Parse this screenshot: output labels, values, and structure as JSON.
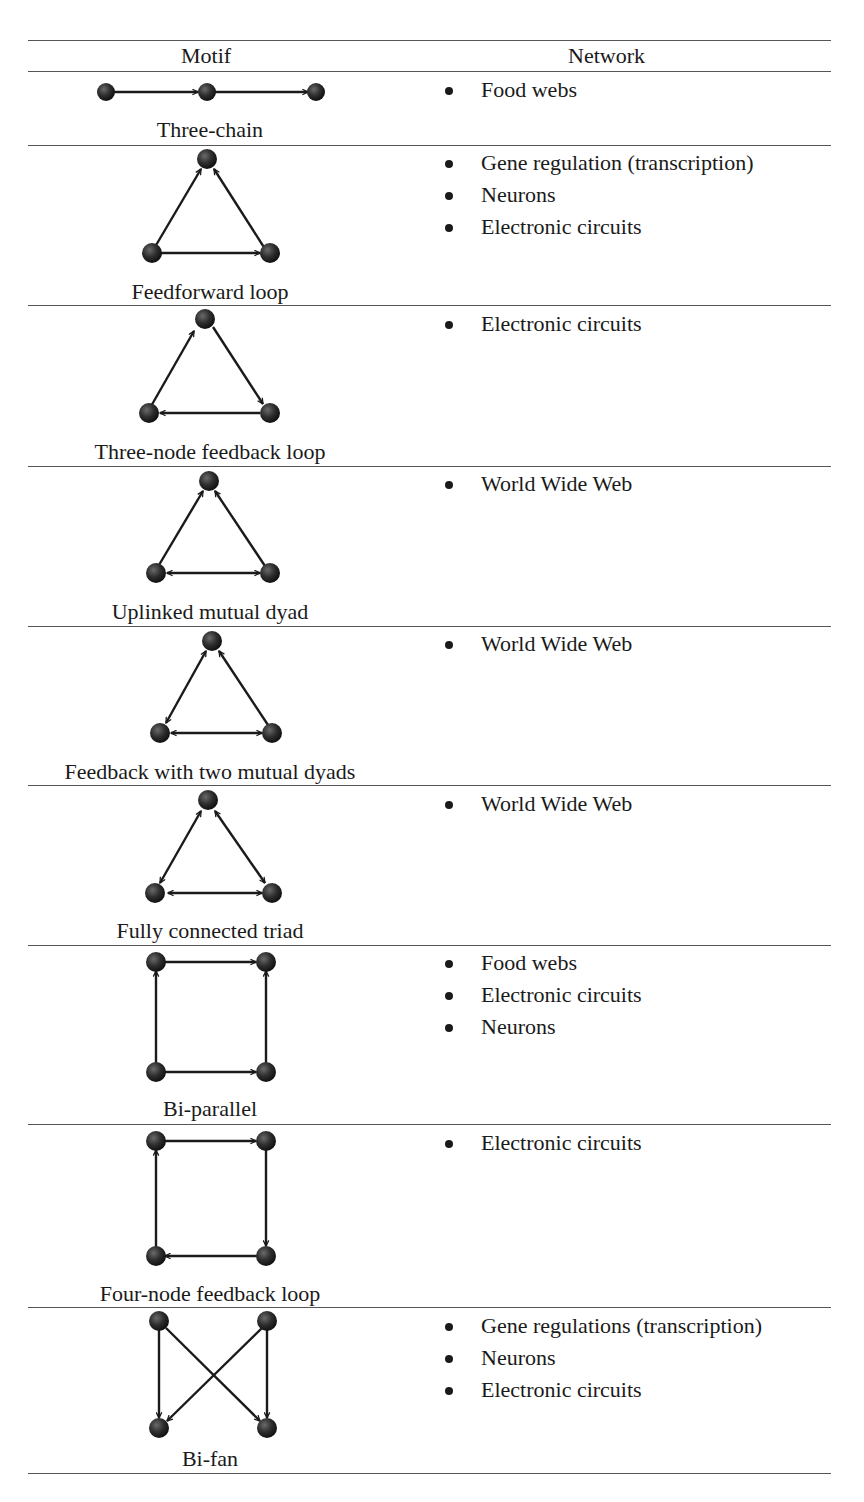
{
  "table": {
    "headers": {
      "motif": "Motif",
      "network": "Network"
    },
    "rows": [
      {
        "motif": "Three-chain",
        "networks": [
          "Food webs"
        ],
        "diagram": {
          "type": "three-chain",
          "edges": [
            "A->B",
            "B->C"
          ]
        }
      },
      {
        "motif": "Feedforward loop",
        "networks": [
          "Gene regulation (transcription)",
          "Neurons",
          "Electronic circuits"
        ],
        "diagram": {
          "type": "triangle",
          "edges": [
            "BL->TOP",
            "BR->TOP",
            "BL->BR"
          ]
        }
      },
      {
        "motif": "Three-node feedback loop",
        "networks": [
          "Electronic circuits"
        ],
        "diagram": {
          "type": "triangle",
          "edges": [
            "BL->TOP",
            "TOP->BR",
            "BR->BL"
          ]
        }
      },
      {
        "motif": "Uplinked mutual dyad",
        "networks": [
          "World Wide Web"
        ],
        "diagram": {
          "type": "triangle",
          "edges": [
            "BL->TOP",
            "BR->TOP",
            "BL<->BR"
          ]
        }
      },
      {
        "motif": "Feedback with two mutual dyads",
        "networks": [
          "World Wide Web"
        ],
        "diagram": {
          "type": "triangle",
          "edges": [
            "BL<->TOP",
            "BR->TOP",
            "BL<->BR"
          ]
        }
      },
      {
        "motif": "Fully connected triad",
        "networks": [
          "World Wide Web"
        ],
        "diagram": {
          "type": "triangle",
          "edges": [
            "BL<->TOP",
            "TOP<->BR",
            "BL<->BR"
          ]
        }
      },
      {
        "motif": "Bi-parallel",
        "networks": [
          "Food webs",
          "Electronic circuits",
          "Neurons"
        ],
        "diagram": {
          "type": "square",
          "edges": [
            "BL->TL",
            "TL->TR",
            "BL->BR",
            "BR->TR"
          ]
        }
      },
      {
        "motif": "Four-node feedback loop",
        "networks": [
          "Electronic circuits"
        ],
        "diagram": {
          "type": "square",
          "edges": [
            "TL->TR",
            "TR->BR",
            "BR->BL",
            "BL->TL"
          ]
        }
      },
      {
        "motif": "Bi-fan",
        "networks": [
          "Gene regulations (transcription)",
          "Neurons",
          "Electronic circuits"
        ],
        "diagram": {
          "type": "square",
          "edges": [
            "TL->BL",
            "TL->BR",
            "TR->BL",
            "TR->BR"
          ]
        }
      }
    ]
  }
}
